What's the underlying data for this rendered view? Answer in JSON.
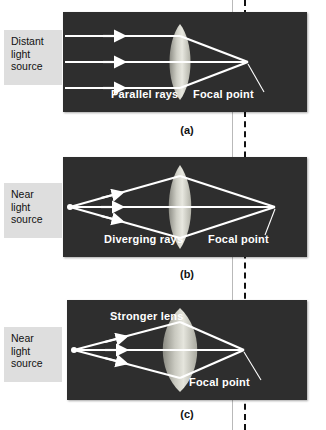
{
  "figure": {
    "background_color": "#ffffff",
    "panel_color": "#2e2e2e",
    "ray_color": "#ffffff",
    "lens_color": "#d8d8cf",
    "label_box_color": "#dedede",
    "dashed_line_color": "#111111",
    "guide_line_color": "#b9b9b9"
  },
  "reference_lines": {
    "solid_guide_label": "image-plane-guide",
    "dashed_focal_label": "focal-plane-dashed"
  },
  "panels": [
    {
      "id": "a",
      "caption": "(a)",
      "source_label": "Distant\nlight\nsource",
      "rays_label": "Parallel rays",
      "focal_label": "Focal point",
      "lens_type": "normal",
      "ray_geometry": "parallel",
      "ray_count": 3
    },
    {
      "id": "b",
      "caption": "(b)",
      "source_label": "Near\nlight\nsource",
      "rays_label": "Diverging rays",
      "focal_label": "Focal point",
      "lens_type": "normal",
      "ray_geometry": "diverging",
      "ray_count": 3
    },
    {
      "id": "c",
      "caption": "(c)",
      "source_label": "Near\nlight\nsource",
      "rays_label": "Stronger lens",
      "focal_label": "Focal point",
      "lens_type": "stronger",
      "ray_geometry": "diverging",
      "ray_count": 3
    }
  ]
}
